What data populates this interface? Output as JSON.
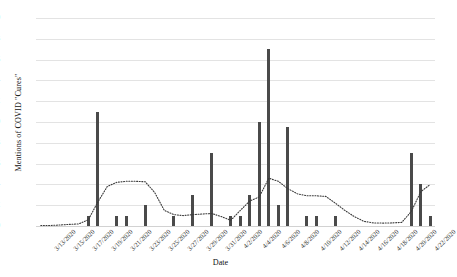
{
  "chart_data": {
    "type": "bar",
    "title": "",
    "xlabel": "Date",
    "ylabel": "Mentions of COVID \"Cures\"",
    "ylim": [
      0,
      20
    ],
    "ytick_step": 2,
    "yticks": [
      20,
      18,
      16,
      14,
      12,
      10,
      8,
      6,
      4,
      2,
      0
    ],
    "grid": true,
    "legend": "none",
    "bar_color": "#4a4a4a",
    "trend_color": "#3a3a3a",
    "gridline_color": "#e3e3e3",
    "xtick_interval_days": 2,
    "xtick_labels": [
      "3/13/2020",
      "3/15/2020",
      "3/17/2020",
      "3/19/2020",
      "3/21/2020",
      "3/23/2020",
      "3/25/2020",
      "3/27/2020",
      "3/29/2020",
      "3/31/2020",
      "4/2/2020",
      "4/4/2020",
      "4/6/2020",
      "4/8/2020",
      "4/10/2020",
      "4/12/2020",
      "4/14/2020",
      "4/16/2020",
      "4/18/2020",
      "4/20/2020",
      "4/22/2020"
    ],
    "categories": [
      "3/13/2020",
      "3/14/2020",
      "3/15/2020",
      "3/16/2020",
      "3/17/2020",
      "3/18/2020",
      "3/19/2020",
      "3/20/2020",
      "3/21/2020",
      "3/22/2020",
      "3/23/2020",
      "3/24/2020",
      "3/25/2020",
      "3/26/2020",
      "3/27/2020",
      "3/28/2020",
      "3/29/2020",
      "3/30/2020",
      "3/31/2020",
      "4/1/2020",
      "4/2/2020",
      "4/3/2020",
      "4/4/2020",
      "4/5/2020",
      "4/6/2020",
      "4/7/2020",
      "4/8/2020",
      "4/9/2020",
      "4/10/2020",
      "4/11/2020",
      "4/12/2020",
      "4/13/2020",
      "4/14/2020",
      "4/15/2020",
      "4/16/2020",
      "4/17/2020",
      "4/18/2020",
      "4/19/2020",
      "4/20/2020",
      "4/21/2020",
      "4/22/2020",
      "4/23/2020"
    ],
    "values": [
      0,
      0,
      0,
      0,
      0,
      1,
      11,
      0,
      1,
      1,
      0,
      2,
      0,
      0,
      1,
      0,
      3,
      0,
      7,
      0,
      1,
      1,
      3,
      10,
      17,
      2,
      9.5,
      0,
      1,
      1,
      0,
      1,
      0,
      0,
      0,
      0,
      0,
      0,
      0,
      7,
      4,
      1
    ],
    "series": [
      {
        "name": "bars",
        "type": "bar",
        "values": [
          0,
          0,
          0,
          0,
          0,
          1,
          11,
          0,
          1,
          1,
          0,
          2,
          0,
          0,
          1,
          0,
          3,
          0,
          7,
          0,
          1,
          1,
          3,
          10,
          17,
          2,
          9.5,
          0,
          1,
          1,
          0,
          1,
          0,
          0,
          0,
          0,
          0,
          0,
          0,
          7,
          4,
          1
        ]
      },
      {
        "name": "trend",
        "type": "line",
        "style": "dotted",
        "values": [
          0.05,
          0.05,
          0.1,
          0.15,
          0.2,
          0.6,
          2.3,
          3.8,
          4.2,
          4.3,
          4.3,
          4.25,
          3.2,
          1.5,
          1.1,
          1.0,
          1.1,
          1.15,
          1.2,
          0.9,
          0.55,
          1.5,
          2.4,
          2.8,
          4.6,
          4.3,
          3.6,
          3.1,
          2.9,
          2.9,
          2.85,
          2.2,
          1.5,
          0.9,
          0.45,
          0.3,
          0.28,
          0.3,
          0.35,
          1.4,
          3.3,
          4.0
        ]
      }
    ]
  }
}
